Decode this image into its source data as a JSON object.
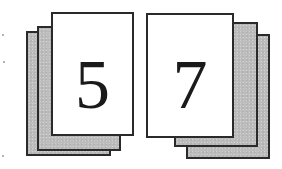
{
  "diagram": {
    "colors": {
      "page_border": "#2a2a2a",
      "front_page_fill": "#ffffff",
      "back_page_fill": "#bdbdbd",
      "numeral": "#1a1a1a"
    },
    "stacks": [
      {
        "name": "left-stack",
        "front_label": "5",
        "pages": [
          {
            "role": "back",
            "x": 26,
            "y": 31,
            "w": 85,
            "h": 125
          },
          {
            "role": "middle",
            "x": 37,
            "y": 26,
            "w": 84,
            "h": 125
          },
          {
            "role": "front",
            "x": 51,
            "y": 12,
            "w": 83,
            "h": 124
          }
        ]
      },
      {
        "name": "right-stack",
        "front_label": "7",
        "pages": [
          {
            "role": "back",
            "x": 186,
            "y": 34,
            "w": 84,
            "h": 125
          },
          {
            "role": "middle",
            "x": 174,
            "y": 22,
            "w": 84,
            "h": 125
          },
          {
            "role": "front",
            "x": 146,
            "y": 13,
            "w": 88,
            "h": 125
          }
        ]
      }
    ]
  }
}
